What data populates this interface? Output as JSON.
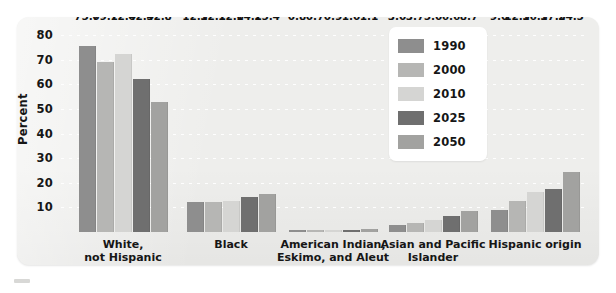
{
  "chart_data": {
    "type": "bar",
    "title": "",
    "xlabel": "",
    "ylabel": "Percent",
    "ylim": [
      0,
      85
    ],
    "yticks": [
      10,
      20,
      30,
      40,
      50,
      60,
      70,
      80
    ],
    "grid": true,
    "legend_position": "inside-top-center",
    "categories": [
      "White,\nnot Hispanic",
      "Black",
      "American Indian,\nEskimo, and Aleut",
      "Asian and Pacific\nIslander",
      "Hispanic origin"
    ],
    "series": [
      {
        "name": "1990",
        "color": "#8e8e8e",
        "values": [
          75.7,
          12.3,
          0.8,
          3.0,
          9.0
        ]
      },
      {
        "name": "2000",
        "color": "#b6b6b4",
        "values": [
          69.1,
          12.1,
          0.7,
          3.7,
          12.5
        ]
      },
      {
        "name": "2010",
        "color": "#d5d5d3",
        "values": [
          72.4,
          12.6,
          0.9,
          5.0,
          16.3
        ]
      },
      {
        "name": "2025",
        "color": "#6f6f6f",
        "values": [
          62.4,
          14.2,
          1.0,
          6.6,
          17.5
        ]
      },
      {
        "name": "2050",
        "color": "#a2a2a0",
        "values": [
          52.8,
          15.4,
          1.1,
          8.7,
          24.5
        ]
      }
    ],
    "value_labels": [
      [
        "75.7",
        "69.1",
        "72.4",
        "62.4",
        "52.8"
      ],
      [
        "12.3",
        "12.1",
        "12.6",
        "14.2",
        "15.4"
      ],
      [
        "0.8",
        "0.7",
        "0.9",
        "1.0",
        "1.1"
      ],
      [
        "3.0",
        "3.7",
        "5.0",
        "6.6",
        "8.7"
      ],
      [
        "9.0",
        "12.5",
        "16.3",
        "17.5",
        "24.5"
      ]
    ]
  },
  "legend": {
    "items": [
      {
        "label": "1990",
        "color": "#8e8e8e"
      },
      {
        "label": "2000",
        "color": "#b6b6b4"
      },
      {
        "label": "2010",
        "color": "#d5d5d3"
      },
      {
        "label": "2025",
        "color": "#6f6f6f"
      },
      {
        "label": "2050",
        "color": "#a2a2a0"
      }
    ]
  },
  "colors": {
    "panel_background": "#eeeeec",
    "page_background": "#ffffff",
    "text": "#161616",
    "gridline": "#ffffff"
  }
}
